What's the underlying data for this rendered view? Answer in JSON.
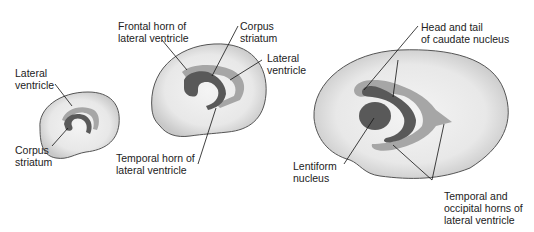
{
  "diagram": {
    "colors": {
      "brain_outline": "#555555",
      "brain_fill": "#d9d9d9",
      "brain_fill_inner": "#f2f2f2",
      "ventricle": "#a6a6a6",
      "striatum": "#595959",
      "leader_line": "#111111",
      "text": "#222222"
    },
    "stages": [
      {
        "size": "small",
        "labels": [
          {
            "id": "lateral-ventricle-1",
            "text": "Lateral\nventricle"
          },
          {
            "id": "corpus-striatum-1",
            "text": "Corpus\nstriatum"
          }
        ]
      },
      {
        "size": "medium",
        "labels": [
          {
            "id": "frontal-horn",
            "text": "Frontal horn of\nlateral ventricle"
          },
          {
            "id": "corpus-striatum-2",
            "text": "Corpus\nstriatum"
          },
          {
            "id": "lateral-ventricle-2",
            "text": "Lateral\nventricle"
          },
          {
            "id": "temporal-horn",
            "text": "Temporal horn of\nlateral ventricle"
          }
        ]
      },
      {
        "size": "large",
        "labels": [
          {
            "id": "caudate-nucleus",
            "text": "Head and tail\nof caudate nucleus"
          },
          {
            "id": "lentiform-nucleus",
            "text": "Lentiform\nnucleus"
          },
          {
            "id": "temporal-occipital-horns",
            "text": "Temporal and\noccipital horns of\nlateral ventricle"
          }
        ]
      }
    ]
  }
}
